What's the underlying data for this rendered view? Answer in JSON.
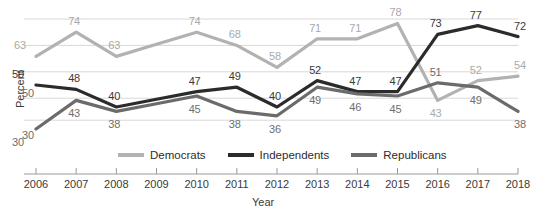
{
  "chart_data": {
    "type": "line",
    "title": "",
    "xlabel": "Year",
    "ylabel": "Percent",
    "x": [
      2006,
      2007,
      2008,
      2009,
      2010,
      2011,
      2012,
      2013,
      2014,
      2015,
      2016,
      2017,
      2018
    ],
    "categories": [
      "2006",
      "2007",
      "2008",
      "2009",
      "2010",
      "2011",
      "2012",
      "2013",
      "2014",
      "2015",
      "2016",
      "2017",
      "2018"
    ],
    "ylim": [
      25,
      85
    ],
    "xlim": [
      2006,
      2018
    ],
    "grid": true,
    "legend_position": "bottom",
    "yticks": [
      30,
      50
    ],
    "ytick_labels": [
      "30",
      "50"
    ],
    "series": [
      {
        "name": "Democrats",
        "color": "#b2b2b2",
        "values": [
          63,
          74,
          63,
          68.5,
          74,
          68,
          58,
          71,
          71,
          78,
          43,
          52,
          54
        ],
        "labels": [
          "63",
          "74",
          "63",
          "",
          "74",
          "68",
          "58",
          "71",
          "71",
          "78",
          "43",
          "52",
          "54"
        ]
      },
      {
        "name": "Independents",
        "color": "#2b2b2b",
        "values": [
          50,
          48,
          40,
          43.5,
          47,
          49,
          40,
          52,
          47,
          47,
          73,
          77,
          72
        ],
        "labels": [
          "50",
          "48",
          "40",
          "",
          "47",
          "49",
          "40",
          "52",
          "47",
          "47",
          "73",
          "77",
          "72"
        ]
      },
      {
        "name": "Republicans",
        "color": "#6b6b6b",
        "values": [
          30,
          43,
          38,
          41.5,
          45,
          38,
          36,
          49,
          46,
          45,
          51,
          49,
          38
        ],
        "labels": [
          "30",
          "43",
          "38",
          "",
          "45",
          "38",
          "36",
          "49",
          "46",
          "45",
          "51",
          "49",
          "38"
        ]
      }
    ],
    "gridlines_y": [
      80,
      68,
      56,
      44,
      34
    ],
    "annotations": []
  },
  "legend": {
    "items": [
      {
        "label": "Democrats",
        "color": "#b2b2b2"
      },
      {
        "label": "Independents",
        "color": "#2b2b2b"
      },
      {
        "label": "Republicans",
        "color": "#6b6b6b"
      }
    ]
  },
  "axes": {
    "y_title": "Percent",
    "x_title": "Year",
    "y_tick_30": "30",
    "y_tick_50": "50"
  }
}
